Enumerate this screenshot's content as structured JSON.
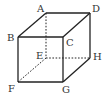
{
  "diagram": {
    "type": "cube",
    "stroke_color": "#222222",
    "vertices": {
      "A": {
        "x": 46,
        "y": 13,
        "label": "A",
        "lx": 37,
        "ly": 12
      },
      "B": {
        "x": 18,
        "y": 37,
        "label": "B",
        "lx": 7,
        "ly": 41
      },
      "C": {
        "x": 63,
        "y": 37,
        "label": "C",
        "lx": 66,
        "ly": 46
      },
      "D": {
        "x": 90,
        "y": 13,
        "label": "D",
        "lx": 92,
        "ly": 12
      },
      "E": {
        "x": 46,
        "y": 58,
        "label": "E",
        "lx": 36,
        "ly": 59
      },
      "F": {
        "x": 18,
        "y": 82,
        "label": "F",
        "lx": 8,
        "ly": 92
      },
      "G": {
        "x": 63,
        "y": 82,
        "label": "G",
        "lx": 62,
        "ly": 93
      },
      "H": {
        "x": 90,
        "y": 58,
        "label": "H",
        "lx": 93,
        "ly": 60
      }
    },
    "solid_edges": [
      [
        "A",
        "D"
      ],
      [
        "A",
        "B"
      ],
      [
        "D",
        "C"
      ],
      [
        "B",
        "C"
      ],
      [
        "B",
        "F"
      ],
      [
        "C",
        "G"
      ],
      [
        "F",
        "G"
      ],
      [
        "D",
        "H"
      ],
      [
        "G",
        "H"
      ]
    ],
    "hidden_edges": [
      [
        "A",
        "E"
      ],
      [
        "E",
        "H"
      ],
      [
        "E",
        "F"
      ]
    ]
  }
}
